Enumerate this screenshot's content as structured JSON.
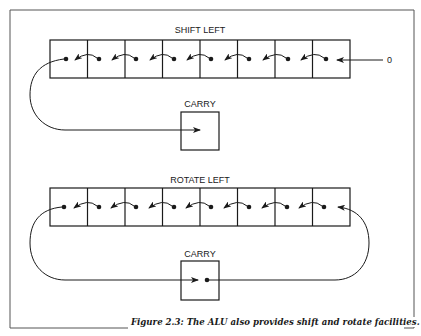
{
  "figure": {
    "caption": "Figure 2.3: The ALU also provides shift and rotate facilities.",
    "shift_left": {
      "title": "SHIFT LEFT",
      "bits": 8,
      "input_label": "0",
      "carry_label": "CARRY"
    },
    "rotate_left": {
      "title": "ROTATE LEFT",
      "bits": 8,
      "carry_label": "CARRY"
    }
  },
  "colors": {
    "line": "#1a1a1a",
    "frame": "#555555",
    "background": "#ffffff"
  }
}
